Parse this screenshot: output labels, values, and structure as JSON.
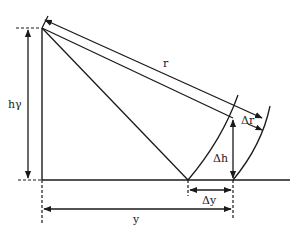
{
  "diagram": {
    "title": "",
    "labels": {
      "r": "r",
      "delta_r": "Δr",
      "h_gamma": "hγ",
      "delta_h": "Δh",
      "delta_y": "Δy",
      "y": "y"
    },
    "colors": {
      "stroke": "#1a1a1a",
      "background": "#ffffff"
    }
  }
}
